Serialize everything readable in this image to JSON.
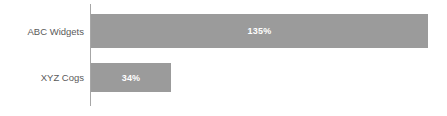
{
  "chart_data": {
    "type": "bar",
    "orientation": "horizontal",
    "title": "",
    "subtitle": "",
    "xlabel": "",
    "ylabel": "",
    "grid": false,
    "legend": "none",
    "axis_visible": true,
    "value_suffix": "%",
    "xlim": [
      0,
      135
    ],
    "categories": [
      "ABC Widgets",
      "XYZ Cogs"
    ],
    "values": [
      135,
      34
    ],
    "value_labels": [
      "135%",
      "34%"
    ],
    "bars": [
      {
        "category": "ABC Widgets",
        "value": 135,
        "label": "135%",
        "px_left": 0,
        "px_width": 337,
        "px_top": 14,
        "px_height": 34,
        "color": "#9b9b9b",
        "label_color": "#ffffff"
      },
      {
        "category": "XYZ Cogs",
        "value": 34,
        "label": "34%",
        "px_left": 0,
        "px_width": 80,
        "px_top": 63,
        "px_height": 29,
        "color": "#9b9b9b",
        "label_color": "#ffffff"
      }
    ],
    "colors": {
      "bar_fill": "#9b9b9b",
      "axis_line": "#a6a6a6",
      "category_label": "#5a5a5a",
      "data_label": "#ffffff",
      "background": "#ffffff"
    },
    "axis": {
      "px_x": 90,
      "px_top": 4,
      "px_height": 102
    }
  }
}
